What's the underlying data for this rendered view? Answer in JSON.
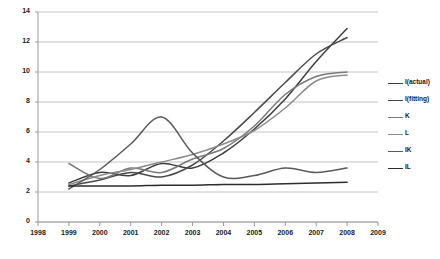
{
  "chart_data": {
    "type": "line",
    "title": "",
    "xlabel": "",
    "ylabel": "",
    "xlim": [
      1998,
      2009
    ],
    "ylim": [
      0,
      14
    ],
    "ytick_step": 2,
    "grid": true,
    "legend_position": "right",
    "xticks": [
      "1998",
      "1999",
      "2000",
      "2001",
      "2002",
      "2003",
      "2004",
      "2005",
      "2006",
      "2007",
      "2008",
      "2009"
    ],
    "yticks": [
      "0",
      "2",
      "4",
      "6",
      "8",
      "10",
      "12",
      "14"
    ],
    "x": [
      1999,
      2000,
      2001,
      2002,
      2003,
      2004,
      2005,
      2006,
      2007,
      2008
    ],
    "series": [
      {
        "name": "I(actual)",
        "color": "#3f3f3f",
        "values": [
          2.6,
          3.3,
          3.1,
          3.9,
          3.6,
          4.6,
          6.2,
          8.2,
          10.7,
          12.9
        ]
      },
      {
        "name": "I(fitting)",
        "color": "#4a4a4a",
        "values": [
          2.4,
          2.8,
          3.3,
          3.0,
          3.8,
          5.4,
          7.3,
          9.3,
          11.2,
          12.3
        ]
      },
      {
        "name": "K",
        "color": "#7a7a7a",
        "values": [
          3.9,
          2.9,
          3.6,
          3.3,
          4.2,
          4.9,
          6.4,
          8.5,
          9.7,
          10.0
        ]
      },
      {
        "name": "L",
        "color": "#8c8c8c",
        "values": [
          2.5,
          3.1,
          3.5,
          4.0,
          4.5,
          5.2,
          6.1,
          7.6,
          9.4,
          9.8
        ]
      },
      {
        "name": "IK",
        "color": "#5a5a5a",
        "values": [
          2.2,
          3.5,
          5.2,
          7.0,
          4.6,
          3.0,
          3.1,
          3.6,
          3.3,
          3.6
        ]
      },
      {
        "name": "IL",
        "color": "#2e2e2e",
        "values": [
          2.4,
          2.4,
          2.4,
          2.45,
          2.45,
          2.5,
          2.5,
          2.55,
          2.6,
          2.65
        ]
      }
    ]
  },
  "legend": {
    "entries": [
      {
        "label": "I(actual)"
      },
      {
        "label": "I(fitting)"
      },
      {
        "label": "K"
      },
      {
        "label": "L"
      },
      {
        "label": "IK"
      },
      {
        "label": "IL"
      }
    ]
  }
}
